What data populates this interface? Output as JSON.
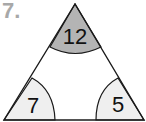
{
  "question_number": "7.",
  "triangle": {
    "angles": [
      {
        "position": "top",
        "value": "12",
        "fill": "#b4b4b4"
      },
      {
        "position": "bottom-left",
        "value": "7",
        "fill": "#efefef"
      },
      {
        "position": "bottom-right",
        "value": "5",
        "fill": "#efefef"
      }
    ],
    "stroke": "#1a1a1a"
  }
}
